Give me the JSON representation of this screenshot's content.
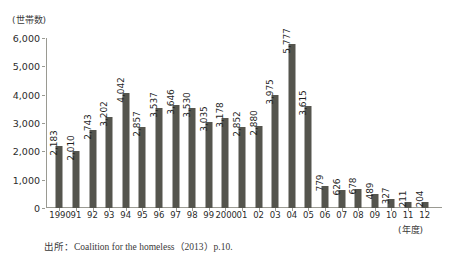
{
  "chart_data": {
    "type": "bar",
    "title": "",
    "subtitle": "",
    "xlabel": "(年度)",
    "ylabel": "(世帯数)",
    "ylim": [
      0,
      6000
    ],
    "ytick_labels": [
      "6,000",
      "5,000",
      "4,000",
      "3,000",
      "2,000",
      "1,000",
      "0"
    ],
    "ytick_values": [
      6000,
      5000,
      4000,
      3000,
      2000,
      1000,
      0
    ],
    "grid": false,
    "legend": "none",
    "bar_color": "#55554e",
    "axis_color": "#9a9a92",
    "categories": [
      "1990",
      "91",
      "92",
      "93",
      "94",
      "95",
      "96",
      "97",
      "98",
      "99",
      "2000",
      "01",
      "02",
      "03",
      "04",
      "05",
      "06",
      "07",
      "08",
      "09",
      "10",
      "11",
      "12"
    ],
    "values": [
      2183,
      2010,
      2743,
      3202,
      4042,
      2857,
      3537,
      3646,
      3530,
      3035,
      3178,
      2852,
      2880,
      3975,
      5777,
      3615,
      779,
      626,
      678,
      489,
      327,
      211,
      204
    ],
    "value_labels": [
      "2,183",
      "2,010",
      "2,743",
      "3,202",
      "4,042",
      "2,857",
      "3,537",
      "3,646",
      "3,530",
      "3,035",
      "3,178",
      "2,852",
      "2,880",
      "3,975",
      "5,777",
      "3,615",
      "779",
      "626",
      "678",
      "489",
      "327",
      "211",
      "204"
    ],
    "data_labels_shown": true,
    "data_label_rotation": -90
  },
  "source_note": "出所：Coalition for the homeless（2013）p.10."
}
